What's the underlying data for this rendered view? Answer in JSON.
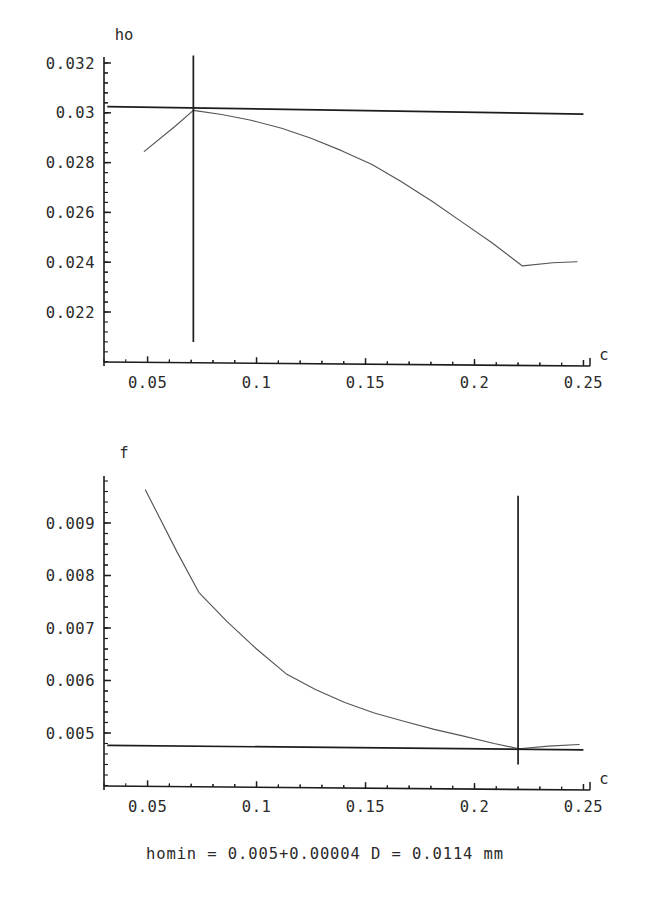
{
  "caption": "homin = 0.005+0.00004 D = 0.0114 mm",
  "charts": [
    {
      "id": "ho-chart",
      "type": "line",
      "title": "",
      "ylabel": "ho",
      "xlabel": "c",
      "xlim": [
        0.03,
        0.253
      ],
      "ylim": [
        0.0208,
        0.0323
      ],
      "grid": false,
      "legend": null,
      "xticks": [
        0.05,
        0.1,
        0.15,
        0.2,
        0.25
      ],
      "xticklabels": [
        "0.05",
        "0.1",
        "0.15",
        "0.2",
        "0.25"
      ],
      "yticks": [
        0.022,
        0.024,
        0.026,
        0.028,
        0.03,
        0.032
      ],
      "yticklabels": [
        "0.022",
        "0.024",
        "0.026",
        "0.028",
        "0.03",
        "0.032"
      ],
      "series": [
        {
          "name": "ho",
          "x": [
            0.0485,
            0.0625,
            0.071,
            0.084,
            0.0975,
            0.1115,
            0.125,
            0.139,
            0.153,
            0.1665,
            0.1805,
            0.1945,
            0.208,
            0.222,
            0.236,
            0.247
          ],
          "y": [
            0.02845,
            0.02945,
            0.0301,
            0.02993,
            0.0297,
            0.02938,
            0.02898,
            0.02848,
            0.02792,
            0.02723,
            0.02645,
            0.0256,
            0.02478,
            0.02385,
            0.02398,
            0.02402
          ]
        },
        {
          "name": "homin-reference",
          "x": [
            0.0315,
            0.25
          ],
          "y": [
            0.03025,
            0.02995
          ]
        }
      ],
      "markers": [
        {
          "name": "optimum-c-marker",
          "orientation": "vertical",
          "x": 0.071,
          "y_from": 0.0208,
          "y_to": 0.0323
        }
      ]
    },
    {
      "id": "f-chart",
      "type": "line",
      "title": "",
      "ylabel": "f",
      "xlabel": "c",
      "xlim": [
        0.03,
        0.253
      ],
      "ylim": [
        0.0044,
        0.0098
      ],
      "grid": false,
      "legend": null,
      "xticks": [
        0.05,
        0.1,
        0.15,
        0.2,
        0.25
      ],
      "xticklabels": [
        "0.05",
        "0.1",
        "0.15",
        "0.2",
        "0.25"
      ],
      "yticks": [
        0.005,
        0.006,
        0.007,
        0.008,
        0.009
      ],
      "yticklabels": [
        "0.005",
        "0.006",
        "0.007",
        "0.008",
        "0.009"
      ],
      "series": [
        {
          "name": "f",
          "x": [
            0.049,
            0.0635,
            0.0735,
            0.0865,
            0.1,
            0.1135,
            0.127,
            0.1405,
            0.154,
            0.168,
            0.1815,
            0.195,
            0.209,
            0.2205,
            0.234,
            0.248
          ],
          "y": [
            0.00963,
            0.00845,
            0.00768,
            0.00712,
            0.0066,
            0.00613,
            0.00583,
            0.00558,
            0.00538,
            0.00522,
            0.00507,
            0.00494,
            0.0048,
            0.0047,
            0.00475,
            0.00478
          ]
        },
        {
          "name": "f-reference",
          "x": [
            0.0315,
            0.25
          ],
          "y": [
            0.004765,
            0.00468
          ]
        }
      ],
      "markers": [
        {
          "name": "optimum-c-marker",
          "orientation": "vertical",
          "x": 0.22,
          "y_from": 0.0044,
          "y_to": 0.00952
        }
      ]
    }
  ],
  "chart_data": {
    "type": "line",
    "panels": [
      {
        "id": "ho-chart",
        "ylabel": "ho",
        "xlabel": "c",
        "xlim": [
          0.03,
          0.253
        ],
        "ylim": [
          0.0208,
          0.0323
        ],
        "xticks": [
          0.05,
          0.1,
          0.15,
          0.2,
          0.25
        ],
        "yticks": [
          0.022,
          0.024,
          0.026,
          0.028,
          0.03,
          0.032
        ],
        "grid": false,
        "legend": null,
        "series": [
          {
            "name": "ho",
            "x": [
              0.0485,
              0.0625,
              0.071,
              0.084,
              0.0975,
              0.1115,
              0.125,
              0.139,
              0.153,
              0.1665,
              0.1805,
              0.1945,
              0.208,
              0.222,
              0.236,
              0.247
            ],
            "values": [
              0.02845,
              0.02945,
              0.0301,
              0.02993,
              0.0297,
              0.02938,
              0.02898,
              0.02848,
              0.02792,
              0.02723,
              0.02645,
              0.0256,
              0.02478,
              0.02385,
              0.02398,
              0.02402
            ]
          },
          {
            "name": "homin reference level",
            "x": [
              0.0315,
              0.25
            ],
            "values": [
              0.03025,
              0.02995
            ]
          }
        ],
        "annotations": [
          {
            "name": "vertical marker at optimum c",
            "x": 0.071
          }
        ]
      },
      {
        "id": "f-chart",
        "ylabel": "f",
        "xlabel": "c",
        "xlim": [
          0.03,
          0.253
        ],
        "ylim": [
          0.0044,
          0.0098
        ],
        "xticks": [
          0.05,
          0.1,
          0.15,
          0.2,
          0.25
        ],
        "yticks": [
          0.005,
          0.006,
          0.007,
          0.008,
          0.009
        ],
        "grid": false,
        "legend": null,
        "series": [
          {
            "name": "f",
            "x": [
              0.049,
              0.0635,
              0.0735,
              0.0865,
              0.1,
              0.1135,
              0.127,
              0.1405,
              0.154,
              0.168,
              0.1815,
              0.195,
              0.209,
              0.2205,
              0.234,
              0.248
            ],
            "values": [
              0.00963,
              0.00845,
              0.00768,
              0.00712,
              0.0066,
              0.00613,
              0.00583,
              0.00558,
              0.00538,
              0.00522,
              0.00507,
              0.00494,
              0.0048,
              0.0047,
              0.00475,
              0.00478
            ]
          },
          {
            "name": "f reference level",
            "x": [
              0.0315,
              0.25
            ],
            "values": [
              0.004765,
              0.00468
            ]
          }
        ],
        "annotations": [
          {
            "name": "vertical marker at optimum c",
            "x": 0.22
          }
        ]
      }
    ],
    "caption": "homin = 0.005+0.00004 D = 0.0114 mm"
  }
}
